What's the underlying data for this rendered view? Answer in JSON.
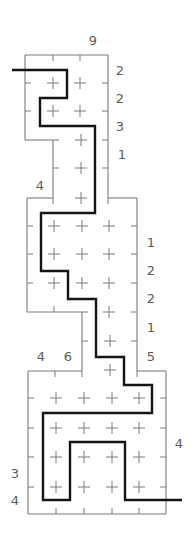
{
  "puzzle": {
    "type": "grid-path-puzzle",
    "colors": {
      "grid": "#7a7a7a",
      "path": "#141414",
      "clue_text": "#5a5a5a",
      "background": "#ffffff"
    },
    "clues": [
      {
        "id": "top-9",
        "text": "9",
        "x": 93,
        "y": 40
      },
      {
        "id": "right-1",
        "text": "2",
        "x": 120,
        "y": 70
      },
      {
        "id": "right-2",
        "text": "2",
        "x": 120,
        "y": 98
      },
      {
        "id": "right-3",
        "text": "3",
        "x": 120,
        "y": 126
      },
      {
        "id": "right-4",
        "text": "1",
        "x": 122,
        "y": 154
      },
      {
        "id": "left-4a",
        "text": "4",
        "x": 40,
        "y": 185
      },
      {
        "id": "right-5",
        "text": "1",
        "x": 151,
        "y": 242
      },
      {
        "id": "right-6",
        "text": "2",
        "x": 151,
        "y": 270
      },
      {
        "id": "right-7",
        "text": "2",
        "x": 151,
        "y": 298
      },
      {
        "id": "right-8",
        "text": "1",
        "x": 151,
        "y": 327
      },
      {
        "id": "right-9",
        "text": "5",
        "x": 151,
        "y": 356
      },
      {
        "id": "top-4",
        "text": "4",
        "x": 41,
        "y": 356
      },
      {
        "id": "top-6",
        "text": "6",
        "x": 68,
        "y": 356
      },
      {
        "id": "right-10",
        "text": "4",
        "x": 179,
        "y": 443
      },
      {
        "id": "left-3",
        "text": "3",
        "x": 15,
        "y": 473
      },
      {
        "id": "left-4b",
        "text": "4",
        "x": 15,
        "y": 500
      }
    ],
    "outline_segments": [
      [
        25,
        55,
        108,
        55
      ],
      [
        25,
        55,
        25,
        140
      ],
      [
        25,
        140,
        53,
        140
      ],
      [
        108,
        55,
        108,
        198
      ],
      [
        53,
        140,
        53,
        198
      ],
      [
        27,
        198,
        53,
        198
      ],
      [
        108,
        198,
        137,
        198
      ],
      [
        27,
        198,
        27,
        312
      ],
      [
        137,
        198,
        137,
        371
      ],
      [
        27,
        312,
        82,
        312
      ],
      [
        82,
        312,
        82,
        371
      ],
      [
        28,
        371,
        82,
        371
      ],
      [
        137,
        371,
        166,
        371
      ],
      [
        28,
        371,
        28,
        514
      ],
      [
        166,
        371,
        166,
        514
      ],
      [
        28,
        514,
        166,
        514
      ]
    ],
    "edge_ticks": [
      {
        "x": 53,
        "y": 55,
        "dir": "down"
      },
      {
        "x": 80,
        "y": 55,
        "dir": "down"
      },
      {
        "x": 25,
        "y": 83,
        "dir": "right"
      },
      {
        "x": 108,
        "y": 83,
        "dir": "left"
      },
      {
        "x": 25,
        "y": 111,
        "dir": "right"
      },
      {
        "x": 108,
        "y": 111,
        "dir": "left"
      },
      {
        "x": 53,
        "y": 140,
        "dir": "right"
      },
      {
        "x": 108,
        "y": 140,
        "dir": "left"
      },
      {
        "x": 53,
        "y": 168,
        "dir": "right"
      },
      {
        "x": 108,
        "y": 168,
        "dir": "left"
      },
      {
        "x": 53,
        "y": 198,
        "dir": "down"
      },
      {
        "x": 108,
        "y": 198,
        "dir": "down"
      },
      {
        "x": 27,
        "y": 226,
        "dir": "right"
      },
      {
        "x": 137,
        "y": 226,
        "dir": "left"
      },
      {
        "x": 27,
        "y": 254,
        "dir": "right"
      },
      {
        "x": 137,
        "y": 254,
        "dir": "left"
      },
      {
        "x": 27,
        "y": 283,
        "dir": "right"
      },
      {
        "x": 137,
        "y": 283,
        "dir": "left"
      },
      {
        "x": 54,
        "y": 312,
        "dir": "up"
      },
      {
        "x": 82,
        "y": 312,
        "dir": "right"
      },
      {
        "x": 137,
        "y": 312,
        "dir": "left"
      },
      {
        "x": 82,
        "y": 341,
        "dir": "right"
      },
      {
        "x": 137,
        "y": 341,
        "dir": "left"
      },
      {
        "x": 82,
        "y": 371,
        "dir": "down"
      },
      {
        "x": 137,
        "y": 371,
        "dir": "down"
      },
      {
        "x": 55,
        "y": 371,
        "dir": "down"
      },
      {
        "x": 28,
        "y": 398,
        "dir": "right"
      },
      {
        "x": 166,
        "y": 398,
        "dir": "left"
      },
      {
        "x": 28,
        "y": 428,
        "dir": "right"
      },
      {
        "x": 166,
        "y": 428,
        "dir": "left"
      },
      {
        "x": 28,
        "y": 457,
        "dir": "right"
      },
      {
        "x": 166,
        "y": 457,
        "dir": "left"
      },
      {
        "x": 28,
        "y": 487,
        "dir": "right"
      },
      {
        "x": 166,
        "y": 487,
        "dir": "left"
      },
      {
        "x": 56,
        "y": 514,
        "dir": "up"
      },
      {
        "x": 84,
        "y": 514,
        "dir": "up"
      },
      {
        "x": 112,
        "y": 514,
        "dir": "up"
      },
      {
        "x": 139,
        "y": 514,
        "dir": "up"
      }
    ],
    "crosses": [
      [
        53,
        83
      ],
      [
        80,
        83
      ],
      [
        53,
        111
      ],
      [
        80,
        111
      ],
      [
        81,
        140
      ],
      [
        81,
        168
      ],
      [
        81,
        198
      ],
      [
        54,
        226
      ],
      [
        82,
        226
      ],
      [
        109,
        226
      ],
      [
        54,
        254
      ],
      [
        82,
        254
      ],
      [
        109,
        254
      ],
      [
        54,
        283
      ],
      [
        82,
        283
      ],
      [
        109,
        283
      ],
      [
        109,
        312
      ],
      [
        110,
        341
      ],
      [
        110,
        370
      ],
      [
        56,
        398
      ],
      [
        84,
        398
      ],
      [
        112,
        398
      ],
      [
        139,
        398
      ],
      [
        56,
        428
      ],
      [
        84,
        428
      ],
      [
        112,
        428
      ],
      [
        139,
        428
      ],
      [
        56,
        457
      ],
      [
        84,
        457
      ],
      [
        112,
        457
      ],
      [
        139,
        457
      ],
      [
        56,
        487
      ],
      [
        84,
        487
      ],
      [
        112,
        487
      ],
      [
        139,
        487
      ]
    ],
    "solution_path": [
      [
        12,
        70
      ],
      [
        67,
        70
      ],
      [
        67,
        98
      ],
      [
        40,
        98
      ],
      [
        40,
        126
      ],
      [
        95,
        126
      ],
      [
        95,
        213
      ],
      [
        41,
        213
      ],
      [
        41,
        271
      ],
      [
        68,
        271
      ],
      [
        68,
        299
      ],
      [
        96,
        299
      ],
      [
        96,
        357
      ],
      [
        124,
        357
      ],
      [
        124,
        385
      ],
      [
        152,
        385
      ],
      [
        152,
        413
      ],
      [
        43,
        413
      ],
      [
        43,
        500
      ],
      [
        70,
        500
      ],
      [
        70,
        442
      ],
      [
        125,
        442
      ],
      [
        125,
        500
      ],
      [
        182,
        500
      ]
    ]
  }
}
